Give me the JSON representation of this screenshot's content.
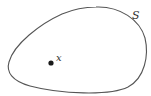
{
  "diagram": {
    "set_label": "S",
    "point_label": "x",
    "colors": {
      "curve": "#555555",
      "point": "#1a1a1a",
      "text": "#333333",
      "background": "#ffffff"
    }
  }
}
